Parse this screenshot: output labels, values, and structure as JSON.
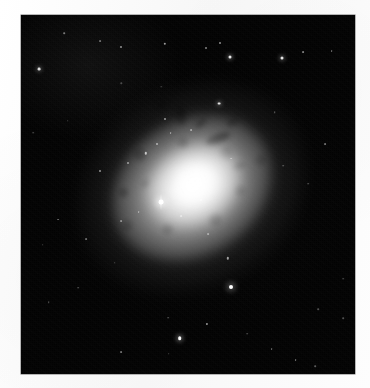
{
  "page": {
    "background_color": "#fbfbfb",
    "clipped_header_text": ". . .  . . .   .  .          . .",
    "kind": "scanned-figure-page"
  },
  "figure": {
    "name": "galaxy-plate",
    "kind": "astronomical-image",
    "color_mode": "grayscale",
    "background_color": "#000000",
    "plate": {
      "x": 21,
      "y": 15,
      "width": 334,
      "height": 359
    },
    "subject": {
      "type": "galaxy",
      "morphology": "elliptical / lenticular with dust patches",
      "center_x": 192,
      "center_y": 188,
      "position_angle_deg": -33,
      "major_axis_px": 238,
      "minor_axis_px": 196,
      "peak_brightness": "#ffffff"
    },
    "stars": [
      {
        "x": 0.055,
        "y": 0.15,
        "r": 1.4,
        "b": 0.85,
        "glow": true
      },
      {
        "x": 0.13,
        "y": 0.05,
        "r": 0.8,
        "b": 0.45,
        "glow": false
      },
      {
        "x": 0.236,
        "y": 0.072,
        "r": 0.9,
        "b": 0.4,
        "glow": false
      },
      {
        "x": 0.3,
        "y": 0.088,
        "r": 1.0,
        "b": 0.55,
        "glow": false
      },
      {
        "x": 0.43,
        "y": 0.08,
        "r": 1.2,
        "b": 0.6,
        "glow": false
      },
      {
        "x": 0.553,
        "y": 0.092,
        "r": 1.0,
        "b": 0.5,
        "glow": false
      },
      {
        "x": 0.625,
        "y": 0.117,
        "r": 1.5,
        "b": 0.92,
        "glow": true
      },
      {
        "x": 0.596,
        "y": 0.078,
        "r": 1.0,
        "b": 0.55,
        "glow": false
      },
      {
        "x": 0.78,
        "y": 0.12,
        "r": 1.5,
        "b": 0.9,
        "glow": true
      },
      {
        "x": 0.845,
        "y": 0.103,
        "r": 0.9,
        "b": 0.48,
        "glow": false
      },
      {
        "x": 0.93,
        "y": 0.1,
        "r": 0.9,
        "b": 0.42,
        "glow": false
      },
      {
        "x": 0.43,
        "y": 0.29,
        "r": 1.0,
        "b": 0.55,
        "glow": false
      },
      {
        "x": 0.592,
        "y": 0.247,
        "r": 1.4,
        "b": 0.88,
        "glow": true
      },
      {
        "x": 0.51,
        "y": 0.32,
        "r": 0.9,
        "b": 0.45,
        "glow": false
      },
      {
        "x": 0.628,
        "y": 0.4,
        "r": 0.9,
        "b": 0.4,
        "glow": false
      },
      {
        "x": 0.76,
        "y": 0.27,
        "r": 0.8,
        "b": 0.35,
        "glow": false
      },
      {
        "x": 0.91,
        "y": 0.36,
        "r": 0.9,
        "b": 0.42,
        "glow": false
      },
      {
        "x": 0.785,
        "y": 0.42,
        "r": 0.8,
        "b": 0.35,
        "glow": false
      },
      {
        "x": 0.86,
        "y": 0.47,
        "r": 0.8,
        "b": 0.33,
        "glow": false
      },
      {
        "x": 0.236,
        "y": 0.435,
        "r": 1.0,
        "b": 0.55,
        "glow": false
      },
      {
        "x": 0.32,
        "y": 0.412,
        "r": 1.0,
        "b": 0.52,
        "glow": false
      },
      {
        "x": 0.374,
        "y": 0.385,
        "r": 1.2,
        "b": 0.68,
        "glow": false
      },
      {
        "x": 0.406,
        "y": 0.358,
        "r": 1.0,
        "b": 0.55,
        "glow": false
      },
      {
        "x": 0.448,
        "y": 0.33,
        "r": 0.9,
        "b": 0.48,
        "glow": false
      },
      {
        "x": 0.352,
        "y": 0.548,
        "r": 0.9,
        "b": 0.45,
        "glow": false
      },
      {
        "x": 0.3,
        "y": 0.575,
        "r": 0.9,
        "b": 0.42,
        "glow": false
      },
      {
        "x": 0.48,
        "y": 0.56,
        "r": 0.9,
        "b": 0.45,
        "glow": false
      },
      {
        "x": 0.54,
        "y": 0.515,
        "r": 1.0,
        "b": 0.5,
        "glow": false
      },
      {
        "x": 0.56,
        "y": 0.61,
        "r": 0.9,
        "b": 0.42,
        "glow": false
      },
      {
        "x": 0.11,
        "y": 0.57,
        "r": 0.9,
        "b": 0.4,
        "glow": false
      },
      {
        "x": 0.196,
        "y": 0.625,
        "r": 0.9,
        "b": 0.4,
        "glow": false
      },
      {
        "x": 0.065,
        "y": 0.64,
        "r": 0.8,
        "b": 0.32,
        "glow": false
      },
      {
        "x": 0.28,
        "y": 0.69,
        "r": 0.8,
        "b": 0.35,
        "glow": false
      },
      {
        "x": 0.62,
        "y": 0.678,
        "r": 1.2,
        "b": 0.6,
        "glow": false
      },
      {
        "x": 0.628,
        "y": 0.757,
        "r": 2.0,
        "b": 1.0,
        "glow": true
      },
      {
        "x": 0.172,
        "y": 0.76,
        "r": 0.8,
        "b": 0.35,
        "glow": false
      },
      {
        "x": 0.083,
        "y": 0.8,
        "r": 0.8,
        "b": 0.33,
        "glow": false
      },
      {
        "x": 0.556,
        "y": 0.86,
        "r": 1.1,
        "b": 0.58,
        "glow": false
      },
      {
        "x": 0.475,
        "y": 0.9,
        "r": 1.8,
        "b": 0.98,
        "glow": true
      },
      {
        "x": 0.44,
        "y": 0.843,
        "r": 0.8,
        "b": 0.35,
        "glow": false
      },
      {
        "x": 0.678,
        "y": 0.888,
        "r": 0.8,
        "b": 0.32,
        "glow": false
      },
      {
        "x": 0.75,
        "y": 0.93,
        "r": 0.9,
        "b": 0.4,
        "glow": false
      },
      {
        "x": 0.442,
        "y": 0.943,
        "r": 0.8,
        "b": 0.33,
        "glow": false
      },
      {
        "x": 0.3,
        "y": 0.938,
        "r": 0.9,
        "b": 0.42,
        "glow": false
      },
      {
        "x": 0.822,
        "y": 0.962,
        "r": 0.9,
        "b": 0.45,
        "glow": false
      },
      {
        "x": 0.88,
        "y": 0.978,
        "r": 0.8,
        "b": 0.35,
        "glow": false
      },
      {
        "x": 0.89,
        "y": 0.82,
        "r": 0.8,
        "b": 0.3,
        "glow": false
      },
      {
        "x": 0.965,
        "y": 0.735,
        "r": 0.8,
        "b": 0.3,
        "glow": false
      },
      {
        "x": 0.965,
        "y": 0.845,
        "r": 0.8,
        "b": 0.3,
        "glow": false
      },
      {
        "x": 0.14,
        "y": 0.295,
        "r": 0.8,
        "b": 0.3,
        "glow": false
      },
      {
        "x": 0.036,
        "y": 0.328,
        "r": 0.8,
        "b": 0.3,
        "glow": false
      },
      {
        "x": 0.3,
        "y": 0.19,
        "r": 0.7,
        "b": 0.26,
        "glow": false
      },
      {
        "x": 0.42,
        "y": 0.2,
        "r": 0.7,
        "b": 0.24,
        "glow": false
      }
    ],
    "bright_point_source": {
      "name": "nucleus-companion-point-source",
      "x": 0.42,
      "y": 0.522,
      "r": 2.4,
      "spike_height": 16,
      "description": "saturated point source with vertical bleed spike"
    },
    "dust_patches": [
      {
        "x": 0.59,
        "y": 0.345,
        "w": 26,
        "h": 9,
        "rot": -22,
        "o": 0.6
      },
      {
        "x": 0.54,
        "y": 0.3,
        "w": 14,
        "h": 6,
        "rot": -40,
        "o": 0.5
      },
      {
        "x": 0.478,
        "y": 0.282,
        "w": 10,
        "h": 18,
        "rot": -6,
        "o": 0.45
      },
      {
        "x": 0.632,
        "y": 0.3,
        "w": 12,
        "h": 7,
        "rot": -30,
        "o": 0.42
      },
      {
        "x": 0.42,
        "y": 0.25,
        "w": 11,
        "h": 6,
        "rot": -18,
        "o": 0.38
      },
      {
        "x": 0.65,
        "y": 0.42,
        "w": 13,
        "h": 6,
        "rot": -14,
        "o": 0.35
      },
      {
        "x": 0.372,
        "y": 0.47,
        "w": 9,
        "h": 5,
        "rot": -50,
        "o": 0.32
      },
      {
        "x": 0.56,
        "y": 0.47,
        "w": 11,
        "h": 5,
        "rot": -10,
        "o": 0.3
      }
    ]
  }
}
